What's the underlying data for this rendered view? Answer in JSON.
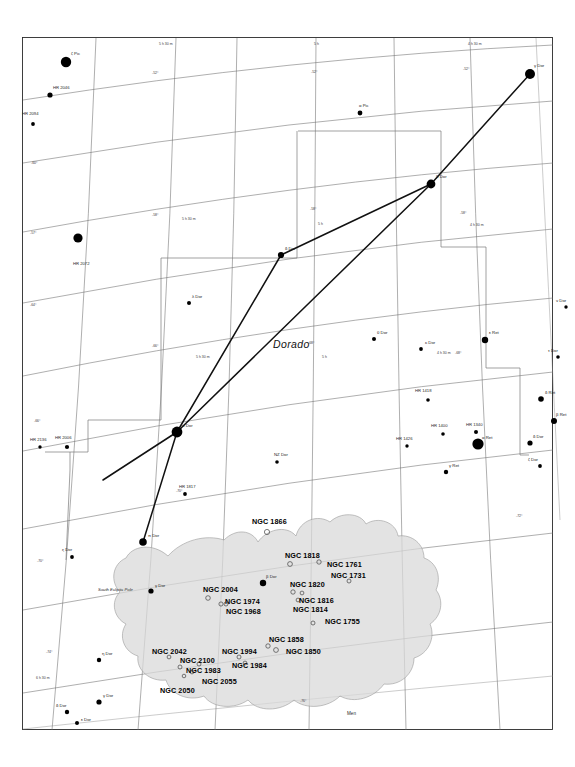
{
  "chart": {
    "constellation_label": "Dorado",
    "neighbour_labels": [
      {
        "name": "Men",
        "x": 347,
        "y": 712
      }
    ],
    "pole_marker": {
      "label": "South Ecliptic Pole",
      "x": 98,
      "y": 588
    },
    "background_color": "#ffffff",
    "frame_color": "#2b2b2b",
    "grid_color": "#6d6d6d",
    "line_color": "#111111",
    "nebula_fill": "#d9d9d9"
  },
  "deep_sky_objects": [
    {
      "label": "NGC 1866",
      "lx": 252,
      "ly": 518,
      "mx": 267,
      "my": 532,
      "r": 2.6
    },
    {
      "label": "NGC 1818",
      "lx": 285,
      "ly": 552,
      "mx": 290,
      "my": 564,
      "r": 2.4
    },
    {
      "label": "NGC 1761",
      "lx": 327,
      "ly": 561,
      "mx": 319,
      "my": 562,
      "r": 2.2
    },
    {
      "label": "NGC 1731",
      "lx": 331,
      "ly": 572,
      "mx": 349,
      "my": 581,
      "r": 2.0
    },
    {
      "label": "NGC 1820",
      "lx": 290,
      "ly": 581,
      "mx": 293,
      "my": 592,
      "r": 2.2
    },
    {
      "label": "NGC 1816",
      "lx": 299,
      "ly": 597,
      "mx": 302,
      "my": 593,
      "r": 1.9
    },
    {
      "label": "NGC 1814",
      "lx": 293,
      "ly": 606,
      "mx": 298,
      "my": 600,
      "r": 1.9
    },
    {
      "label": "NGC 1755",
      "lx": 325,
      "ly": 618,
      "mx": 313,
      "my": 623,
      "r": 2.0
    },
    {
      "label": "NGC 1858",
      "lx": 269,
      "ly": 636,
      "mx": 268,
      "my": 646,
      "r": 2.2
    },
    {
      "label": "NGC 1850",
      "lx": 286,
      "ly": 648,
      "mx": 276,
      "my": 650,
      "r": 2.4
    },
    {
      "label": "NGC 2004",
      "lx": 203,
      "ly": 586,
      "mx": 208,
      "my": 598,
      "r": 2.3
    },
    {
      "label": "NGC 1974",
      "lx": 225,
      "ly": 598,
      "mx": 221,
      "my": 604,
      "r": 2.1
    },
    {
      "label": "NGC 1968",
      "lx": 226,
      "ly": 608,
      "mx": 226,
      "my": 604,
      "r": 2.0
    },
    {
      "label": "NGC 1994",
      "lx": 222,
      "ly": 648,
      "mx": 239,
      "my": 657,
      "r": 2.0
    },
    {
      "label": "NGC 2042",
      "lx": 152,
      "ly": 648,
      "mx": 169,
      "my": 657,
      "r": 1.9
    },
    {
      "label": "NGC 2100",
      "lx": 180,
      "ly": 657,
      "mx": 199,
      "my": 664,
      "r": 2.0
    },
    {
      "label": "NGC 1984",
      "lx": 232,
      "ly": 662,
      "mx": 245,
      "my": 663,
      "r": 1.9
    },
    {
      "label": "NGC 1983",
      "lx": 186,
      "ly": 667,
      "mx": 180,
      "my": 667,
      "r": 2.0
    },
    {
      "label": "NGC 2055",
      "lx": 202,
      "ly": 678,
      "mx": 192,
      "my": 672,
      "r": 1.9
    },
    {
      "label": "NGC 2050",
      "lx": 160,
      "ly": 687,
      "mx": 184,
      "my": 676,
      "r": 1.8
    }
  ],
  "stars": [
    {
      "label": "ζ Pic",
      "mag": 1,
      "x": 66,
      "y": 62,
      "r": 5.2,
      "lx": 71,
      "ly": 52
    },
    {
      "label": "HR 2046",
      "mag": 4,
      "x": 50,
      "y": 95,
      "r": 2.6,
      "lx": 53,
      "ly": 86
    },
    {
      "label": "HR 2094",
      "mag": 5,
      "x": 33,
      "y": 124,
      "r": 1.9,
      "lx": 22,
      "ly": 112
    },
    {
      "label": "α Pic",
      "mag": 3,
      "x": 360,
      "y": 113,
      "r": 2.4,
      "lx": 359,
      "ly": 104
    },
    {
      "label": "γ Dor",
      "mag": 1,
      "x": 530,
      "y": 74,
      "r": 5.0,
      "lx": 534,
      "ly": 64
    },
    {
      "label": "HR 2072",
      "mag": 1,
      "x": 78,
      "y": 238,
      "r": 4.6,
      "lx": 73,
      "ly": 262
    },
    {
      "label": "β Dor",
      "mag": 2,
      "x": 431,
      "y": 184,
      "r": 4.4,
      "lx": 436,
      "ly": 175
    },
    {
      "label": "δ Dor",
      "mag": 3,
      "x": 281,
      "y": 255,
      "r": 3.1,
      "lx": 285,
      "ly": 247
    },
    {
      "label": "λ Dor",
      "mag": 5,
      "x": 189,
      "y": 303,
      "r": 2.0,
      "lx": 192,
      "ly": 295
    },
    {
      "label": "θ Dor",
      "mag": 5,
      "x": 374,
      "y": 339,
      "r": 2.0,
      "lx": 377,
      "ly": 331
    },
    {
      "label": "κ Dor",
      "mag": 5,
      "x": 421,
      "y": 349,
      "r": 1.9,
      "lx": 425,
      "ly": 341
    },
    {
      "label": "ε Ret",
      "mag": 3,
      "x": 485,
      "y": 340,
      "r": 3.2,
      "lx": 489,
      "ly": 331
    },
    {
      "label": "α Dor",
      "mag": 1,
      "x": 177,
      "y": 432,
      "r": 5.4,
      "lx": 182,
      "ly": 424
    },
    {
      "label": "HR 1418",
      "mag": 5,
      "x": 428,
      "y": 400,
      "r": 1.8,
      "lx": 415,
      "ly": 389
    },
    {
      "label": "HR 1400",
      "mag": 5,
      "x": 443,
      "y": 434,
      "r": 1.8,
      "lx": 431,
      "ly": 424
    },
    {
      "label": "HR 1426",
      "mag": 5,
      "x": 407,
      "y": 446,
      "r": 1.7,
      "lx": 396,
      "ly": 437
    },
    {
      "label": "α Ret",
      "mag": 1,
      "x": 478,
      "y": 444,
      "r": 5.6,
      "lx": 482,
      "ly": 436
    },
    {
      "label": "HR 1340",
      "mag": 4,
      "x": 476,
      "y": 432,
      "r": 2.0,
      "lx": 466,
      "ly": 423
    },
    {
      "label": "γ Ret",
      "mag": 4,
      "x": 446,
      "y": 472,
      "r": 2.2,
      "lx": 449,
      "ly": 464
    },
    {
      "label": "δ Ret",
      "mag": 4,
      "x": 541,
      "y": 399,
      "r": 2.8,
      "lx": 545,
      "ly": 391
    },
    {
      "label": "β Ret",
      "mag": 3,
      "x": 554,
      "y": 421,
      "r": 3.0,
      "lx": 556,
      "ly": 413
    },
    {
      "label": "δ Dor",
      "mag": 4,
      "x": 530,
      "y": 443,
      "r": 2.6,
      "lx": 533,
      "ly": 435
    },
    {
      "label": "HR 2006",
      "mag": 5,
      "x": 67,
      "y": 447,
      "r": 2.1,
      "lx": 55,
      "ly": 436
    },
    {
      "label": "HR 2136",
      "mag": 5,
      "x": 40,
      "y": 447,
      "r": 1.7,
      "lx": 30,
      "ly": 438
    },
    {
      "label": "NZ Dor",
      "mag": 5,
      "x": 277,
      "y": 462,
      "r": 1.8,
      "lx": 274,
      "ly": 453
    },
    {
      "label": "HR 1817",
      "mag": 5,
      "x": 185,
      "y": 494,
      "r": 1.9,
      "lx": 179,
      "ly": 485
    },
    {
      "label": "π Dor",
      "mag": 2,
      "x": 143,
      "y": 542,
      "r": 3.8,
      "lx": 148,
      "ly": 534
    },
    {
      "label": "ς Dor",
      "mag": 5,
      "x": 72,
      "y": 557,
      "r": 1.9,
      "lx": 62,
      "ly": 548
    },
    {
      "label": "γ Dor",
      "mag": 3,
      "x": 151,
      "y": 591,
      "r": 2.6,
      "lx": 155,
      "ly": 584
    },
    {
      "label": "β Dor",
      "mag": 2,
      "x": 263,
      "y": 583,
      "r": 3.2,
      "lx": 266,
      "ly": 575
    },
    {
      "label": "η Dor",
      "mag": 4,
      "x": 99,
      "y": 660,
      "r": 2.2,
      "lx": 102,
      "ly": 652
    },
    {
      "label": "γ Dor",
      "mag": 3,
      "x": 99,
      "y": 702,
      "r": 2.6,
      "lx": 103,
      "ly": 694
    },
    {
      "label": "δ Dor",
      "mag": 4,
      "x": 67,
      "y": 712,
      "r": 2.2,
      "lx": 56,
      "ly": 704
    },
    {
      "label": "ε Dor",
      "mag": 4,
      "x": 77,
      "y": 723,
      "r": 2.0,
      "lx": 81,
      "ly": 718
    },
    {
      "label": "ζ Dor",
      "mag": 4,
      "x": 540,
      "y": 466,
      "r": 1.9,
      "lx": 528,
      "ly": 458
    },
    {
      "label": "τ Dor",
      "mag": 5,
      "x": 558,
      "y": 357,
      "r": 1.8,
      "lx": 548,
      "ly": 349
    },
    {
      "label": "ν Dor",
      "mag": 5,
      "x": 566,
      "y": 307,
      "r": 1.7,
      "lx": 556,
      "ly": 299
    }
  ],
  "grid_labels": [
    {
      "text": "5 h 30 m",
      "x": 159,
      "y": 43
    },
    {
      "text": "5 h",
      "x": 314,
      "y": 43
    },
    {
      "text": "4 h 30 m",
      "x": 468,
      "y": 43
    },
    {
      "text": "-52°",
      "x": 152,
      "y": 72
    },
    {
      "text": "-52°",
      "x": 311,
      "y": 71
    },
    {
      "text": "-52°",
      "x": 463,
      "y": 68
    },
    {
      "text": "-57°",
      "x": 30,
      "y": 232
    },
    {
      "text": "-58°",
      "x": 152,
      "y": 214
    },
    {
      "text": "-58°",
      "x": 310,
      "y": 208
    },
    {
      "text": "-58°",
      "x": 460,
      "y": 212
    },
    {
      "text": "-60°",
      "x": 31,
      "y": 162
    },
    {
      "text": "-64°",
      "x": 30,
      "y": 304
    },
    {
      "text": "-66°",
      "x": 34,
      "y": 420
    },
    {
      "text": "-66°",
      "x": 152,
      "y": 345
    },
    {
      "text": "-68°",
      "x": 308,
      "y": 342
    },
    {
      "text": "-68°",
      "x": 455,
      "y": 352
    },
    {
      "text": "-70°",
      "x": 37,
      "y": 560
    },
    {
      "text": "-70°",
      "x": 176,
      "y": 490
    },
    {
      "text": "-72°",
      "x": 516,
      "y": 515
    },
    {
      "text": "6 h 30 m",
      "x": 36,
      "y": 677
    },
    {
      "text": "-74°",
      "x": 46,
      "y": 651
    },
    {
      "text": "-76°",
      "x": 300,
      "y": 700
    },
    {
      "text": "4 h 30 m",
      "x": 470,
      "y": 224
    },
    {
      "text": "5 h 30 m",
      "x": 182,
      "y": 218
    },
    {
      "text": "5 h 30 m",
      "x": 196,
      "y": 356
    },
    {
      "text": "4 h 30 m",
      "x": 437,
      "y": 352
    },
    {
      "text": "5 h",
      "x": 318,
      "y": 223
    },
    {
      "text": "5 h",
      "x": 322,
      "y": 356
    }
  ]
}
